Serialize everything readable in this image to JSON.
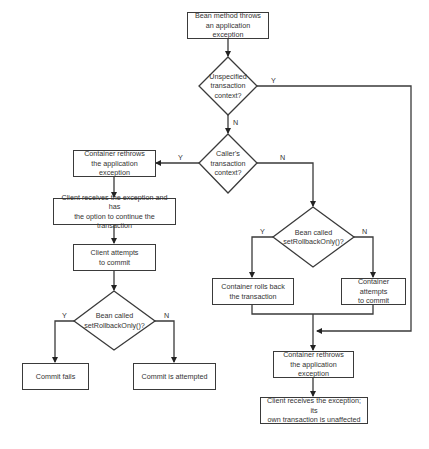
{
  "diagram": {
    "type": "flowchart",
    "title": "",
    "nodes": {
      "start": {
        "kind": "process",
        "lines": [
          "Bean method throws",
          "an application exception"
        ]
      },
      "d_unspecified": {
        "kind": "decision",
        "lines": [
          "Unspecified",
          "transaction",
          "context?"
        ]
      },
      "d_caller": {
        "kind": "decision",
        "lines": [
          "Caller's",
          "transaction",
          "context?"
        ]
      },
      "left_rethrow": {
        "kind": "process",
        "lines": [
          "Container rethrows",
          "the application exception"
        ]
      },
      "client_option": {
        "kind": "process",
        "lines": [
          "Client receives the exception and has",
          "the option to continue the transaction"
        ]
      },
      "client_commit": {
        "kind": "process",
        "lines": [
          "Client attempts",
          "to commit"
        ]
      },
      "d_rollback_left": {
        "kind": "decision",
        "lines": [
          "Bean called",
          "setRollbackOnly()?"
        ]
      },
      "commit_fails": {
        "kind": "process",
        "lines": [
          "Commit fails"
        ]
      },
      "commit_attempted": {
        "kind": "process",
        "lines": [
          "Commit is attempted"
        ]
      },
      "d_rollback_right": {
        "kind": "decision",
        "lines": [
          "Bean called",
          "setRollbackOnly()?"
        ]
      },
      "rolls_back": {
        "kind": "process",
        "lines": [
          "Container rolls back",
          "the transaction"
        ]
      },
      "container_commit": {
        "kind": "process",
        "lines": [
          "Container attempts",
          "to commit"
        ]
      },
      "right_rethrow": {
        "kind": "process",
        "lines": [
          "Container rethrows",
          "the application exception"
        ]
      },
      "client_unaffected": {
        "kind": "process",
        "lines": [
          "Client receives the exception; its",
          "own transaction is unaffected"
        ]
      }
    },
    "edges": [
      {
        "from": "start",
        "to": "d_unspecified",
        "label": ""
      },
      {
        "from": "d_unspecified",
        "to": "right_rethrow",
        "label": "Y"
      },
      {
        "from": "d_unspecified",
        "to": "d_caller",
        "label": "N"
      },
      {
        "from": "d_caller",
        "to": "left_rethrow",
        "label": "Y"
      },
      {
        "from": "d_caller",
        "to": "d_rollback_right",
        "label": "N"
      },
      {
        "from": "left_rethrow",
        "to": "client_option",
        "label": ""
      },
      {
        "from": "client_option",
        "to": "client_commit",
        "label": ""
      },
      {
        "from": "client_commit",
        "to": "d_rollback_left",
        "label": ""
      },
      {
        "from": "d_rollback_left",
        "to": "commit_fails",
        "label": "Y"
      },
      {
        "from": "d_rollback_left",
        "to": "commit_attempted",
        "label": "N"
      },
      {
        "from": "d_rollback_right",
        "to": "rolls_back",
        "label": "Y"
      },
      {
        "from": "d_rollback_right",
        "to": "container_commit",
        "label": "N"
      },
      {
        "from": "rolls_back",
        "to": "right_rethrow",
        "label": ""
      },
      {
        "from": "container_commit",
        "to": "right_rethrow",
        "label": ""
      },
      {
        "from": "right_rethrow",
        "to": "client_unaffected",
        "label": ""
      }
    ],
    "labels": {
      "yes": "Y",
      "no": "N"
    },
    "colors": {
      "stroke": "#3a3a3a",
      "text": "#333333",
      "background": "#ffffff"
    }
  }
}
